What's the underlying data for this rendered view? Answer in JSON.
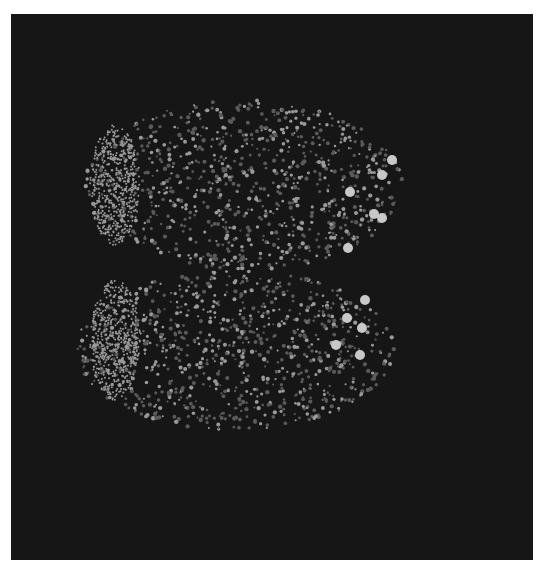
{
  "image": {
    "description": "Fluorescence micrograph of bilobed tissue with punctate nuclei on dark background",
    "background_color": "#161616",
    "border_color": "#ffffff"
  },
  "lobes": [
    {
      "name": "upper-lobe",
      "cx": 245,
      "cy": 185,
      "rx": 160,
      "ry": 85,
      "dense_left_cx": 120,
      "dense_left_cy": 185
    },
    {
      "name": "lower-lobe",
      "cx": 235,
      "cy": 350,
      "rx": 160,
      "ry": 80,
      "dense_left_cx": 120,
      "dense_left_cy": 340
    }
  ],
  "bright_cells": [
    [
      382,
      175
    ],
    [
      392,
      160
    ],
    [
      350,
      192
    ],
    [
      374,
      214
    ],
    [
      382,
      218
    ],
    [
      348,
      248
    ],
    [
      365,
      300
    ],
    [
      347,
      318
    ],
    [
      362,
      328
    ],
    [
      336,
      345
    ],
    [
      360,
      355
    ]
  ],
  "colors": {
    "dot": "#9a9a9a",
    "dim_dot": "#5a5a5a",
    "bright": "#c8c8c8"
  }
}
